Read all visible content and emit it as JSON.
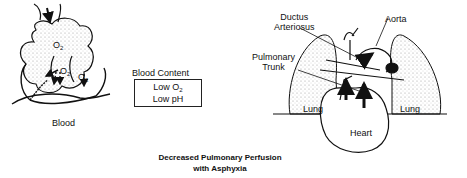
{
  "diagram": {
    "title_line1": "Decreased Pulmonary Perfusion",
    "title_line2": "with Asphyxia",
    "alveoli": {
      "gas_label": "O",
      "gas_subscript": "2",
      "blood_label": "Blood"
    },
    "blood_content": {
      "heading": "Blood Content",
      "line1_prefix": "Low O",
      "line1_subscript": "2",
      "line2": "Low pH"
    },
    "heart": {
      "labels": {
        "ductus_line1": "Ductus",
        "ductus_line2": "Arteriosus",
        "aorta": "Aorta",
        "pulmonary_line1": "Pulmonary",
        "pulmonary_line2": "Trunk",
        "lung_left": "Lung",
        "lung_right": "Lung",
        "heart": "Heart"
      }
    },
    "colors": {
      "ink": "#111111",
      "background": "#ffffff",
      "stipple": "#888888"
    }
  }
}
